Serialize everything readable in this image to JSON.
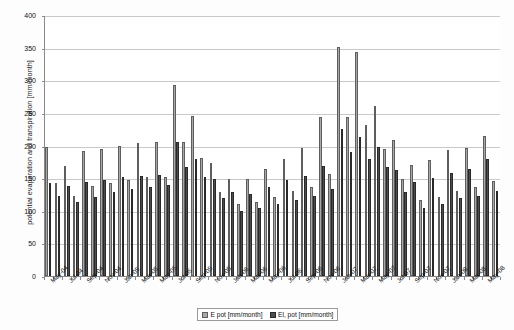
{
  "chart_data": {
    "type": "bar",
    "title": "",
    "xlabel": "",
    "ylabel": "potential evaporation and transpiration [mm/month]",
    "ylim": [
      0,
      400
    ],
    "ytick_step": 50,
    "yticks": [
      0,
      50,
      100,
      150,
      200,
      250,
      300,
      350,
      400
    ],
    "grid": true,
    "legend_position": "bottom",
    "colors": {
      "series1": "#a8a8a8",
      "series2": "#4c4c4c"
    },
    "categories": [
      "May-04",
      "Jun-04",
      "Jul-04",
      "Aug-04",
      "Sep-04",
      "Oct-04",
      "Nov-04",
      "Dec-04",
      "Jan-05",
      "Feb-05",
      "Mar-05",
      "Apr-05",
      "May-05",
      "Jun-05",
      "Jul-05",
      "Aug-05",
      "Sep-05",
      "Oct-05",
      "Nov-05",
      "Dec-05",
      "Jan-06",
      "Feb-06",
      "Mar-06",
      "Apr-06",
      "May-06",
      "Jun-06",
      "Jul-06",
      "Aug-06",
      "Sep-06",
      "Oct-06",
      "Nov-06",
      "Dec-06",
      "Jan-07",
      "Feb-07",
      "Mar-07",
      "Apr-07",
      "May-07",
      "Jun-07",
      "Jul-07",
      "Aug-07",
      "Sep-07",
      "Oct-07",
      "Nov-07",
      "Dec-07",
      "Jan-08",
      "Feb-08",
      "Mar-08",
      "Apr-08",
      "May-08",
      "Jun-08"
    ],
    "xtick_labels": [
      "May-04",
      "Jul-04",
      "Sep-04",
      "Nov-04",
      "Jan-05",
      "Mar-05",
      "May-05",
      "Jul-05",
      "Sep-05",
      "Nov-05",
      "Jan-06",
      "Mar-06",
      "May-06",
      "Jul-06",
      "Sep-06",
      "Nov-06",
      "Jan-07",
      "Mar-07",
      "May-07",
      "Jul-07",
      "Sep-07",
      "Nov-07",
      "Jan-08",
      "Mar-08",
      "May-08"
    ],
    "series": [
      {
        "name": "E pot [mm/month]",
        "values": [
          198,
          147,
          168,
          123,
          191,
          138,
          194,
          143,
          199,
          147,
          204,
          152,
          205,
          152,
          292,
          205,
          246,
          180,
          172,
          127,
          147,
          109,
          148,
          113,
          164,
          120,
          179,
          129,
          196,
          136,
          244,
          155,
          351,
          243,
          344,
          232,
          260,
          193,
          208,
          148,
          169,
          115,
          177,
          120,
          192,
          130,
          195,
          135,
          214,
          145
        ]
      },
      {
        "name": "El, pot [mm/month]",
        "values": [
          181,
          141,
          160,
          115,
          176,
          126,
          181,
          133,
          186,
          139,
          190,
          143,
          191,
          142,
          268,
          194,
          225,
          168,
          159,
          120,
          137,
          102,
          138,
          106,
          152,
          113,
          166,
          121,
          182,
          128,
          224,
          146,
          322,
          226,
          316,
          218,
          239,
          182,
          192,
          139,
          157,
          108,
          164,
          113,
          178,
          122,
          181,
          127,
          198,
          137
        ]
      }
    ],
    "series1_values": [
      198,
      143,
      168,
      123,
      191,
      138,
      194,
      143,
      199,
      147,
      204,
      152,
      205,
      152,
      292,
      205,
      246,
      179,
      172,
      127,
      147,
      109,
      148,
      113,
      164,
      120,
      178,
      129,
      196,
      136,
      244,
      155,
      351,
      243,
      344,
      232,
      260,
      193,
      208,
      148,
      169,
      115,
      177,
      120,
      192,
      130,
      195,
      135,
      214,
      145
    ],
    "series2_values": [
      143,
      122,
      137,
      112,
      143,
      120,
      147,
      128,
      151,
      132,
      152,
      136,
      155,
      139,
      205,
      166,
      179,
      151,
      148,
      118,
      127,
      99,
      125,
      103,
      135,
      110,
      146,
      116,
      153,
      121,
      168,
      132,
      224,
      189,
      212,
      178,
      196,
      166,
      162,
      128,
      143,
      104,
      149,
      110,
      157,
      118,
      163,
      122,
      178,
      130
    ],
    "bars_series1": [
      198,
      143,
      168,
      122,
      191,
      138,
      194,
      143,
      199,
      147,
      204,
      152,
      206,
      152,
      292,
      205,
      246,
      181,
      173,
      129,
      148,
      110,
      148,
      113,
      164,
      121,
      179,
      130,
      196,
      137,
      244,
      156,
      351,
      243,
      344,
      232,
      261,
      194,
      208,
      149,
      170,
      116,
      178,
      121,
      193,
      131,
      196,
      136,
      214,
      146
    ],
    "bars_series2": [
      143,
      123,
      138,
      113,
      144,
      121,
      147,
      128,
      152,
      133,
      153,
      137,
      155,
      140,
      205,
      167,
      180,
      152,
      149,
      119,
      128,
      100,
      126,
      104,
      136,
      111,
      147,
      117,
      154,
      122,
      169,
      133,
      225,
      190,
      213,
      179,
      197,
      167,
      163,
      129,
      144,
      105,
      150,
      111,
      158,
      119,
      164,
      123,
      179,
      131
    ],
    "annotations": []
  },
  "legend": {
    "items": [
      {
        "label": "E pot [mm/month]",
        "swatch": "light"
      },
      {
        "label": "El, pot [mm/month]",
        "swatch": "dark"
      }
    ]
  },
  "axes": {
    "y_title": "potential evaporation and transpiration [mm/month]",
    "y_max_label": "400",
    "y_min_label": "0"
  }
}
